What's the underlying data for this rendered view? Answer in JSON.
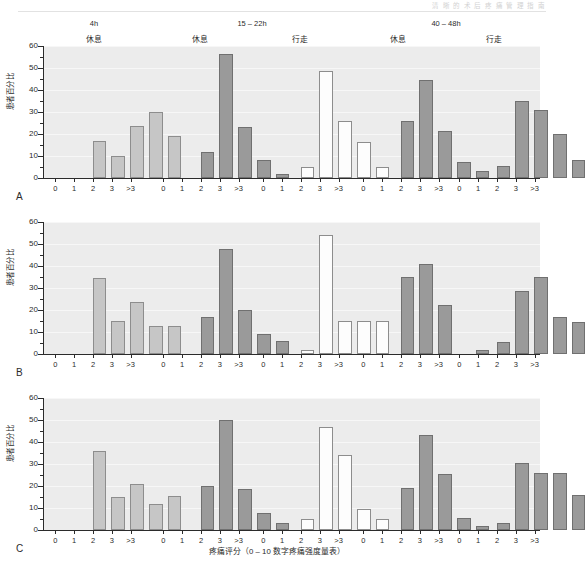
{
  "running_head": "清 晰 的 术 后 疼 痛 管 理 指 南",
  "axis": {
    "y_title": "患者百分比",
    "x_title": "疼痛评分（0 – 10 数字疼痛强度量表）",
    "y_ticks": [
      0,
      10,
      20,
      30,
      40,
      50,
      60
    ],
    "y_min": 0,
    "y_max": 60,
    "categories": [
      "0",
      "1",
      "2",
      "3",
      ">3"
    ]
  },
  "headers": {
    "times": [
      {
        "label": "4h",
        "left": 44,
        "width": 100
      },
      {
        "label": "15 – 22h",
        "left": 152,
        "width": 200
      },
      {
        "label": "40 – 48h",
        "left": 352,
        "width": 188
      }
    ],
    "conditions": [
      {
        "label": "休息",
        "left": 44,
        "width": 100
      },
      {
        "label": "休息",
        "left": 152,
        "width": 96
      },
      {
        "label": "行走",
        "left": 252,
        "width": 96
      },
      {
        "label": "休息",
        "left": 352,
        "width": 92
      },
      {
        "label": "行走",
        "left": 448,
        "width": 92
      }
    ]
  },
  "panels": [
    {
      "letter": "A"
    },
    {
      "letter": "B"
    },
    {
      "letter": "C"
    }
  ],
  "chart_data": {
    "type": "bar",
    "title": "",
    "xlabel": "疼痛评分（0 – 10 数字疼痛强度量表）",
    "ylabel": "患者百分比",
    "ylim": [
      0,
      60
    ],
    "grid": true,
    "legend": null,
    "categories": [
      "0",
      "1",
      "2",
      "3",
      ">3"
    ],
    "group_headers": {
      "times": [
        "4h",
        "15 – 22h",
        "15 – 22h",
        "40 – 48h",
        "40 – 48h"
      ],
      "conditions": [
        "休息",
        "休息",
        "行走",
        "休息",
        "行走"
      ]
    },
    "panels": [
      {
        "letter": "A",
        "groups": [
          {
            "time": "4h",
            "condition": "休息",
            "fill": "light",
            "values": [
              17.0,
              10.2,
              23.8,
              30.0,
              19.0
            ]
          },
          {
            "time": "15 – 22h",
            "condition": "休息",
            "fill": "dark",
            "values": [
              12.0,
              56.2,
              23.0,
              8.0,
              2.0
            ]
          },
          {
            "time": "15 – 22h",
            "condition": "行走",
            "fill": "white",
            "values": [
              5.0,
              48.5,
              26.0,
              16.5,
              5.0
            ]
          },
          {
            "time": "40 – 48h",
            "condition": "休息",
            "fill": "dark",
            "values": [
              26.0,
              44.5,
              21.5,
              7.5,
              3.0
            ]
          },
          {
            "time": "40 – 48h",
            "condition": "行走",
            "fill": "dark",
            "values": [
              5.5,
              35.0,
              31.0,
              20.0,
              8.0
            ]
          }
        ]
      },
      {
        "letter": "B",
        "groups": [
          {
            "time": "4h",
            "condition": "休息",
            "fill": "light",
            "values": [
              34.6,
              14.8,
              23.8,
              12.8,
              12.8
            ]
          },
          {
            "time": "15 – 22h",
            "condition": "休息",
            "fill": "dark",
            "values": [
              16.6,
              47.6,
              20.2,
              9.2,
              5.8
            ]
          },
          {
            "time": "15 – 22h",
            "condition": "行走",
            "fill": "white",
            "values": [
              2.0,
              54.2,
              15.0,
              15.0,
              15.0
            ]
          },
          {
            "time": "40 – 48h",
            "condition": "休息",
            "fill": "dark",
            "values": [
              34.8,
              41.0,
              22.4,
              0.0,
              2.0
            ]
          },
          {
            "time": "40 – 48h",
            "condition": "行走",
            "fill": "dark",
            "values": [
              5.5,
              28.5,
              35.0,
              17.0,
              14.5
            ]
          }
        ]
      },
      {
        "letter": "C",
        "groups": [
          {
            "time": "4h",
            "condition": "休息",
            "fill": "light",
            "values": [
              35.8,
              15.0,
              20.8,
              12.0,
              15.6
            ]
          },
          {
            "time": "15 – 22h",
            "condition": "休息",
            "fill": "dark",
            "values": [
              20.2,
              50.2,
              18.8,
              7.8,
              3.0
            ]
          },
          {
            "time": "15 – 22h",
            "condition": "行走",
            "fill": "white",
            "values": [
              5.0,
              47.0,
              34.0,
              9.5,
              5.0
            ]
          },
          {
            "time": "40 – 48h",
            "condition": "休息",
            "fill": "dark",
            "values": [
              19.0,
              43.0,
              25.5,
              5.5,
              2.0
            ]
          },
          {
            "time": "40 – 48h",
            "condition": "行走",
            "fill": "dark",
            "values": [
              3.0,
              30.5,
              26.0,
              26.0,
              16.0
            ]
          }
        ]
      }
    ]
  }
}
